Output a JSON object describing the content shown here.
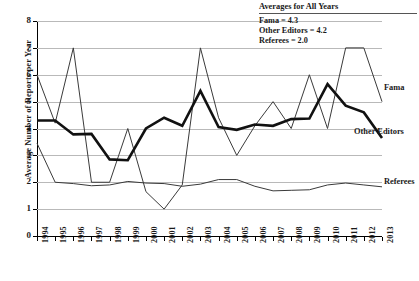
{
  "chart_data": {
    "type": "line",
    "title": "",
    "xlabel": "",
    "ylabel": "Average Number of Reports per Year",
    "ylim": [
      0,
      8
    ],
    "yticks": [
      0,
      1,
      2,
      3,
      4,
      5,
      6,
      7,
      8
    ],
    "grid": true,
    "legend_position": "right-inline",
    "categories": [
      "1994",
      "1995",
      "1996",
      "1997",
      "1998",
      "1999",
      "2000",
      "2001",
      "2002",
      "2003",
      "2004",
      "2005",
      "2006",
      "2007",
      "2008",
      "2009",
      "2010",
      "2011",
      "2012",
      "2013"
    ],
    "series": [
      {
        "name": "Fama",
        "style": "thin",
        "color": "#3a3a3a",
        "values": [
          6.0,
          4.2,
          7.0,
          2.0,
          2.0,
          4.0,
          1.65,
          1.0,
          1.9,
          7.0,
          4.4,
          3.0,
          4.1,
          5.0,
          4.0,
          6.0,
          4.0,
          7.0,
          7.0,
          5.0
        ]
      },
      {
        "name": "Other Editors",
        "style": "thick",
        "color": "#111111",
        "values": [
          4.3,
          4.3,
          3.78,
          3.8,
          2.85,
          2.82,
          4.0,
          4.4,
          4.1,
          5.4,
          4.05,
          3.95,
          4.15,
          4.1,
          4.35,
          4.37,
          5.65,
          4.85,
          4.6,
          3.65
        ]
      },
      {
        "name": "Referees",
        "style": "thin",
        "color": "#3a3a3a",
        "values": [
          3.45,
          2.0,
          1.95,
          1.87,
          1.9,
          2.03,
          1.97,
          1.95,
          1.85,
          1.93,
          2.1,
          2.1,
          1.85,
          1.68,
          1.7,
          1.72,
          1.9,
          1.97,
          1.9,
          1.83
        ]
      }
    ],
    "annotation": {
      "title": "Averages for All Years",
      "lines": [
        "Fama = 4.3",
        "Other Editors = 4.2",
        "Referees = 2.0"
      ]
    },
    "series_labels": {
      "fama": "Fama",
      "other_editors": "Other Editors",
      "referees": "Referees"
    }
  }
}
